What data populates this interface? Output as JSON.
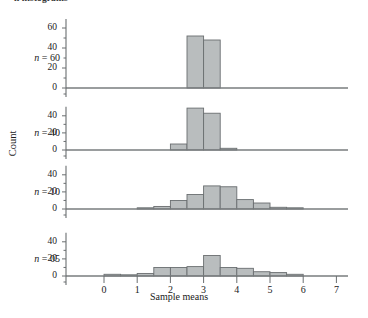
{
  "figure": {
    "clipped_top_caption": "n histograms",
    "y_axis_title": "Count",
    "x_axis_title": "Sample means"
  },
  "chart_data": {
    "type": "bar",
    "title": "",
    "subtitle": "",
    "xlabel": "Sample means",
    "ylabel": "Count",
    "xlim": [
      -0.35,
      7.2
    ],
    "xticks": [
      0,
      1,
      2,
      3,
      4,
      5,
      6,
      7
    ],
    "xtick_labels": [
      "0",
      "1",
      "2",
      "3",
      "4",
      "5",
      "6",
      "7"
    ],
    "grid": false,
    "legend": "none",
    "panel_layout": "stacked-vertical",
    "bin_width": 0.5,
    "panels": [
      {
        "label": "n = 60",
        "yticks": [
          0,
          20,
          40,
          60
        ],
        "ytick_labels": [
          "0",
          "20",
          "40",
          "60"
        ],
        "ylim": [
          0,
          65
        ],
        "bins": [
          {
            "x0": 2.5,
            "x1": 3.0,
            "count": 52
          },
          {
            "x0": 3.0,
            "x1": 3.5,
            "count": 48
          }
        ]
      },
      {
        "label": "n = 40",
        "yticks": [
          0,
          20,
          40
        ],
        "ytick_labels": [
          "0",
          "20",
          "40"
        ],
        "ylim": [
          0,
          55
        ],
        "bins": [
          {
            "x0": 2.0,
            "x1": 2.5,
            "count": 7
          },
          {
            "x0": 2.5,
            "x1": 3.0,
            "count": 49
          },
          {
            "x0": 3.0,
            "x1": 3.5,
            "count": 43
          },
          {
            "x0": 3.5,
            "x1": 4.0,
            "count": 2
          }
        ]
      },
      {
        "label": "n = 10",
        "yticks": [
          0,
          20,
          40
        ],
        "ytick_labels": [
          "0",
          "20",
          "40"
        ],
        "ylim": [
          0,
          45
        ],
        "bins": [
          {
            "x0": 1.0,
            "x1": 1.5,
            "count": 1
          },
          {
            "x0": 1.5,
            "x1": 2.0,
            "count": 3
          },
          {
            "x0": 2.0,
            "x1": 2.5,
            "count": 10
          },
          {
            "x0": 2.5,
            "x1": 3.0,
            "count": 17
          },
          {
            "x0": 3.0,
            "x1": 3.5,
            "count": 27
          },
          {
            "x0": 3.5,
            "x1": 4.0,
            "count": 26
          },
          {
            "x0": 4.0,
            "x1": 4.5,
            "count": 11
          },
          {
            "x0": 4.5,
            "x1": 5.0,
            "count": 7
          },
          {
            "x0": 5.0,
            "x1": 5.5,
            "count": 2
          },
          {
            "x0": 5.5,
            "x1": 6.0,
            "count": 1
          }
        ]
      },
      {
        "label": "n = 05",
        "yticks": [
          0,
          20,
          40
        ],
        "ytick_labels": [
          "0",
          "20",
          "40"
        ],
        "ylim": [
          0,
          45
        ],
        "bins": [
          {
            "x0": 0.0,
            "x1": 0.5,
            "count": 2
          },
          {
            "x0": 0.5,
            "x1": 1.0,
            "count": 1
          },
          {
            "x0": 1.0,
            "x1": 1.5,
            "count": 3
          },
          {
            "x0": 1.5,
            "x1": 2.0,
            "count": 10
          },
          {
            "x0": 2.0,
            "x1": 2.5,
            "count": 10
          },
          {
            "x0": 2.5,
            "x1": 3.0,
            "count": 11
          },
          {
            "x0": 3.0,
            "x1": 3.5,
            "count": 24
          },
          {
            "x0": 3.5,
            "x1": 4.0,
            "count": 10
          },
          {
            "x0": 4.0,
            "x1": 4.5,
            "count": 9
          },
          {
            "x0": 4.5,
            "x1": 5.0,
            "count": 5
          },
          {
            "x0": 5.0,
            "x1": 5.5,
            "count": 4
          },
          {
            "x0": 5.5,
            "x1": 6.0,
            "count": 2
          }
        ]
      }
    ]
  }
}
